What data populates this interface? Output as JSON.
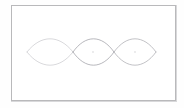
{
  "figure": {
    "background_color": "#ffffff",
    "page_color": "#fefefe",
    "frame": {
      "visible": true,
      "stroke_color": "#b9b9bb",
      "shadow_color": "#d8d8da",
      "x": 11,
      "y": 5,
      "width": 165,
      "height": 96,
      "stroke_width": 1
    },
    "axis": {
      "centerline_y": 52,
      "left_tip_x": 27,
      "right_tip_x": 156,
      "crossing_1_x": 73,
      "crossing_2_x": 114,
      "top_extent_y": 39,
      "bottom_extent_y": 64
    },
    "stroke_width": 0.7,
    "lenses": [
      {
        "name": "lens-left",
        "x_start": 27,
        "x_end": 73,
        "half_height": 13,
        "stroke_color": "#c9c9cd",
        "center_x": 50,
        "center_y": 52,
        "center_mark": false
      },
      {
        "name": "lens-middle",
        "x_start": 73,
        "x_end": 114,
        "half_height": 13,
        "stroke_color": "#9a9aa0",
        "center_x": 93,
        "center_y": 52,
        "center_mark": true
      },
      {
        "name": "lens-right",
        "x_start": 114,
        "x_end": 156,
        "half_height": 13,
        "stroke_color": "#a8a8ae",
        "center_x": 135,
        "center_y": 52,
        "center_mark": true
      }
    ]
  },
  "chart_data": {
    "type": "line",
    "subtitle": "",
    "xlabel": "",
    "ylabel": "",
    "xlim": [
      11,
      176
    ],
    "ylim": [
      5,
      101
    ],
    "grid": false,
    "legend": "none",
    "annotations": [],
    "series": [
      {
        "name": "lens-left-upper",
        "color": "#c9c9cd",
        "x": [
          27,
          38,
          50,
          62,
          73
        ],
        "y": [
          52,
          42,
          39,
          42,
          52
        ]
      },
      {
        "name": "lens-left-lower",
        "color": "#c9c9cd",
        "x": [
          27,
          38,
          50,
          62,
          73
        ],
        "y": [
          52,
          62,
          65,
          62,
          52
        ]
      },
      {
        "name": "lens-middle-upper",
        "color": "#9a9aa0",
        "x": [
          73,
          83,
          93,
          104,
          114
        ],
        "y": [
          52,
          42,
          39,
          42,
          52
        ]
      },
      {
        "name": "lens-middle-lower",
        "color": "#9a9aa0",
        "x": [
          73,
          83,
          93,
          104,
          114
        ],
        "y": [
          52,
          62,
          65,
          62,
          52
        ]
      },
      {
        "name": "lens-right-upper",
        "color": "#a8a8ae",
        "x": [
          114,
          124,
          135,
          146,
          156
        ],
        "y": [
          52,
          42,
          39,
          42,
          52
        ]
      },
      {
        "name": "lens-right-lower",
        "color": "#a8a8ae",
        "x": [
          114,
          124,
          135,
          146,
          156
        ],
        "y": [
          52,
          62,
          65,
          62,
          52
        ]
      }
    ]
  }
}
